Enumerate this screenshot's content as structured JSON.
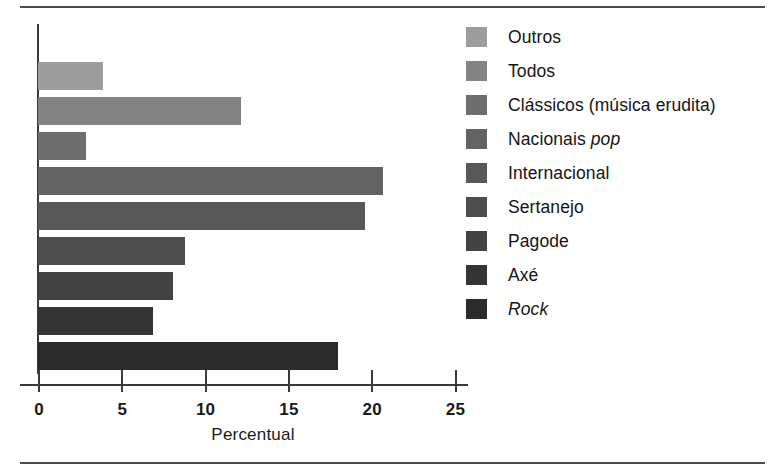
{
  "figure": {
    "background_color": "#ffffff",
    "rule_color": "#4a4a4a",
    "axis_color": "#3a3a3a"
  },
  "chart_data": {
    "type": "bar",
    "orientation": "horizontal",
    "title": "",
    "subtitle": "",
    "xlabel": "Percentual",
    "ylabel": "",
    "xlim": [
      0,
      27.5
    ],
    "xticks": [
      0,
      5,
      10,
      15,
      20,
      25
    ],
    "xtick_labels": [
      "0",
      "5",
      "10",
      "15",
      "20",
      "25"
    ],
    "grid": false,
    "legend_position": "right",
    "categories": [
      "Outros",
      "Todos",
      "Clássicos (música erudita)",
      "Nacionais pop",
      "Internacional",
      "Sertanejo",
      "Pagode",
      "Axé",
      "Rock"
    ],
    "values": [
      3.9,
      12.2,
      2.9,
      20.7,
      19.6,
      8.8,
      8.1,
      6.9,
      18.0
    ],
    "colors": [
      "#9d9d9d",
      "#838383",
      "#6e6e6e",
      "#636363",
      "#585858",
      "#4d4d4d",
      "#424242",
      "#343434",
      "#2b2b2b"
    ],
    "series": [
      {
        "name": "Percentual",
        "values": [
          3.9,
          12.2,
          2.9,
          20.7,
          19.6,
          8.8,
          8.1,
          6.9,
          18.0
        ]
      }
    ]
  },
  "legend": {
    "items": [
      {
        "label": "Outros",
        "label_pre": "Outros",
        "label_italic": "",
        "label_post": "",
        "color": "#9d9d9d"
      },
      {
        "label": "Todos",
        "label_pre": "Todos",
        "label_italic": "",
        "label_post": "",
        "color": "#838383"
      },
      {
        "label": "Clássicos (música erudita)",
        "label_pre": "Clássicos (música erudita)",
        "label_italic": "",
        "label_post": "",
        "color": "#6e6e6e"
      },
      {
        "label": "Nacionais pop",
        "label_pre": "Nacionais ",
        "label_italic": "pop",
        "label_post": "",
        "color": "#636363"
      },
      {
        "label": "Internacional",
        "label_pre": "Internacional",
        "label_italic": "",
        "label_post": "",
        "color": "#585858"
      },
      {
        "label": "Sertanejo",
        "label_pre": "Sertanejo",
        "label_italic": "",
        "label_post": "",
        "color": "#4d4d4d"
      },
      {
        "label": "Pagode",
        "label_pre": "Pagode",
        "label_italic": "",
        "label_post": "",
        "color": "#424242"
      },
      {
        "label": "Axé",
        "label_pre": "Axé",
        "label_italic": "",
        "label_post": "",
        "color": "#343434"
      },
      {
        "label": "Rock",
        "label_pre": "",
        "label_italic": "Rock",
        "label_post": "",
        "color": "#2b2b2b"
      }
    ]
  }
}
